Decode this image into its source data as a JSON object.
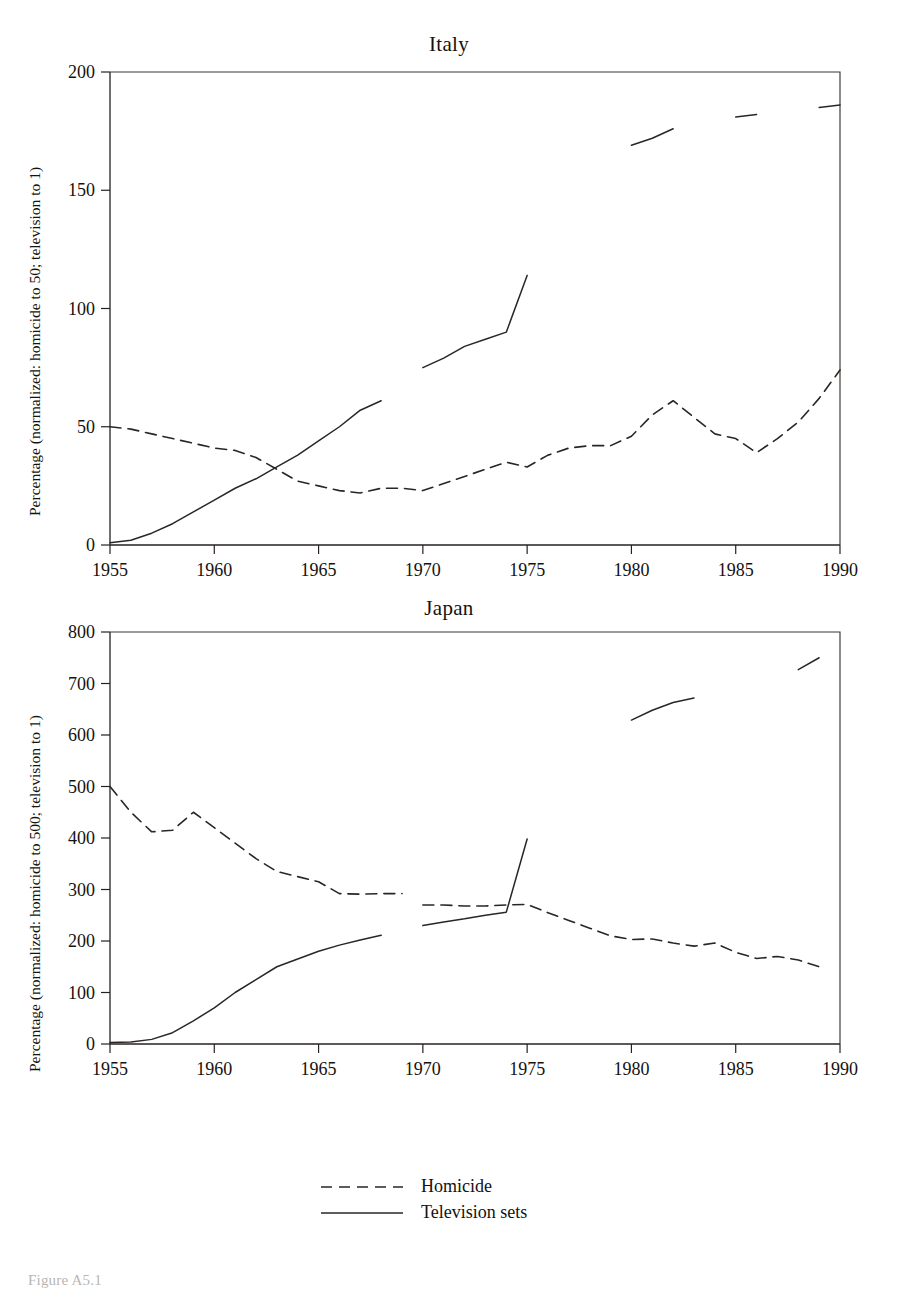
{
  "figure": {
    "caption": "Figure A5.1"
  },
  "legend": {
    "position": "bottom-center",
    "entries": [
      {
        "label": "Homicide",
        "style": "dashed"
      },
      {
        "label": "Television sets",
        "style": "solid"
      }
    ]
  },
  "chart_data": [
    {
      "type": "line",
      "title": "Italy",
      "xlabel": "",
      "ylabel": "Percentage (normalized: homicide to 50; television to 1)",
      "xlim": [
        1955,
        1990
      ],
      "ylim": [
        0,
        200
      ],
      "xticks": [
        1955,
        1960,
        1965,
        1970,
        1975,
        1980,
        1985,
        1990
      ],
      "yticks": [
        0,
        50,
        100,
        150,
        200
      ],
      "grid": false,
      "series": [
        {
          "name": "Homicide",
          "style": "dashed",
          "x": [
            1955,
            1956,
            1957,
            1958,
            1959,
            1960,
            1961,
            1962,
            1963,
            1964,
            1965,
            1966,
            1967,
            1968,
            1969,
            1970,
            1971,
            1972,
            1973,
            1974,
            1975,
            1976,
            1977,
            1978,
            1979,
            1980,
            1981,
            1982,
            1983,
            1984,
            1985,
            1986,
            1987,
            1988,
            1989,
            1990
          ],
          "values": [
            50,
            49,
            47,
            45,
            43,
            41,
            40,
            37,
            32,
            27,
            25,
            23,
            22,
            24,
            24,
            23,
            26,
            29,
            32,
            35,
            33,
            38,
            41,
            42,
            42,
            46,
            55,
            61,
            54,
            47,
            45,
            39,
            45,
            52,
            62,
            74
          ]
        },
        {
          "name": "Television sets",
          "style": "solid",
          "segments": [
            {
              "x": [
                1955,
                1956,
                1957,
                1958,
                1959,
                1960,
                1961,
                1962,
                1963,
                1964,
                1965,
                1966,
                1967,
                1968
              ],
              "values": [
                1,
                2,
                5,
                9,
                14,
                19,
                24,
                28,
                33,
                38,
                44,
                50,
                57,
                61
              ]
            },
            {
              "x": [
                1970,
                1971,
                1972,
                1973,
                1974,
                1975
              ],
              "values": [
                75,
                79,
                84,
                87,
                90,
                114
              ]
            },
            {
              "x": [
                1980,
                1981,
                1982
              ],
              "values": [
                169,
                172,
                176
              ]
            },
            {
              "x": [
                1985,
                1986
              ],
              "values": [
                181,
                182
              ]
            },
            {
              "x": [
                1989,
                1990
              ],
              "values": [
                185,
                186
              ]
            }
          ]
        }
      ]
    },
    {
      "type": "line",
      "title": "Japan",
      "xlabel": "",
      "ylabel": "Percentage (normalized: homicide to 500; television to 1)",
      "xlim": [
        1955,
        1990
      ],
      "ylim": [
        0,
        800
      ],
      "xticks": [
        1955,
        1960,
        1965,
        1970,
        1975,
        1980,
        1985,
        1990
      ],
      "yticks": [
        0,
        100,
        200,
        300,
        400,
        500,
        600,
        700,
        800
      ],
      "grid": false,
      "series": [
        {
          "name": "Homicide",
          "style": "dashed",
          "segments": [
            {
              "x": [
                1955,
                1956,
                1957,
                1958,
                1959,
                1960,
                1961,
                1962,
                1963,
                1964,
                1965,
                1966,
                1967,
                1968,
                1969
              ],
              "values": [
                500,
                450,
                412,
                415,
                450,
                420,
                390,
                360,
                335,
                325,
                315,
                292,
                291,
                292,
                292
              ]
            },
            {
              "x": [
                1970,
                1971,
                1972,
                1973,
                1974,
                1975,
                1976,
                1977,
                1978,
                1979,
                1980,
                1981,
                1982,
                1983,
                1984,
                1985,
                1986,
                1987,
                1988,
                1989
              ],
              "values": [
                270,
                270,
                268,
                268,
                270,
                271,
                255,
                240,
                225,
                210,
                203,
                204,
                196,
                190,
                196,
                178,
                166,
                170,
                163,
                150
              ]
            }
          ]
        },
        {
          "name": "Television sets",
          "style": "solid",
          "segments": [
            {
              "x": [
                1955,
                1956,
                1957,
                1958,
                1959,
                1960,
                1961,
                1962,
                1963,
                1964,
                1965,
                1966,
                1967,
                1968
              ],
              "values": [
                3,
                4,
                9,
                22,
                45,
                70,
                100,
                125,
                150,
                165,
                180,
                192,
                202,
                211
              ]
            },
            {
              "x": [
                1970,
                1971,
                1972,
                1973,
                1974,
                1975
              ],
              "values": [
                230,
                237,
                243,
                250,
                256,
                398
              ]
            },
            {
              "x": [
                1980,
                1981,
                1982,
                1983
              ],
              "values": [
                629,
                648,
                663,
                672
              ]
            },
            {
              "x": [
                1988,
                1989
              ],
              "values": [
                727,
                750
              ]
            }
          ]
        }
      ]
    }
  ]
}
